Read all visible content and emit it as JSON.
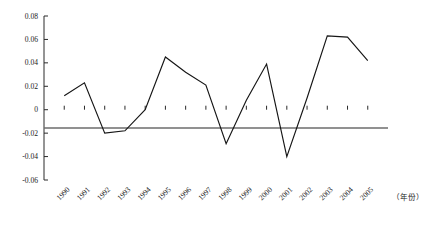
{
  "chart_data": {
    "type": "line",
    "title": "",
    "subtitle": "",
    "xlabel": "（年份）",
    "ylabel": "",
    "grid": false,
    "legend": "none",
    "x": [
      "1990",
      "1991",
      "1992",
      "1993",
      "1994",
      "1995",
      "1996",
      "1997",
      "1998",
      "1999",
      "2000",
      "2001",
      "2002",
      "2003",
      "2004",
      "2005"
    ],
    "categories": [
      "1990",
      "1991",
      "1992",
      "1993",
      "1994",
      "1995",
      "1996",
      "1997",
      "1998",
      "1999",
      "2000",
      "2001",
      "2002",
      "2003",
      "2004",
      "2005"
    ],
    "values": [
      0.012,
      0.023,
      -0.02,
      -0.018,
      0.0,
      0.045,
      0.032,
      0.021,
      -0.029,
      0.008,
      0.039,
      -0.04,
      0.01,
      0.063,
      0.062,
      0.042
    ],
    "series": [
      {
        "name": "",
        "values": [
          0.012,
          0.023,
          -0.02,
          -0.018,
          0.0,
          0.045,
          0.032,
          0.021,
          -0.029,
          0.008,
          0.039,
          -0.04,
          0.01,
          0.063,
          0.062,
          0.042
        ]
      }
    ],
    "ylim": [
      -0.06,
      0.08
    ],
    "xlim": [
      "1990",
      "2005"
    ],
    "ytick_labels": [
      "0.08",
      "0.06",
      "0.04",
      "0.02",
      "0",
      "-0.02",
      "-0.04",
      "-0.06"
    ],
    "ytick_values": [
      0.08,
      0.06,
      0.04,
      0.02,
      0,
      -0.02,
      -0.04,
      -0.06
    ],
    "colors": {
      "series_line": "#151515",
      "axis": "#2a2a2a",
      "zero_axis": "#6d6d6d",
      "background": "#ffffff",
      "text": "#1b1b1b"
    }
  }
}
